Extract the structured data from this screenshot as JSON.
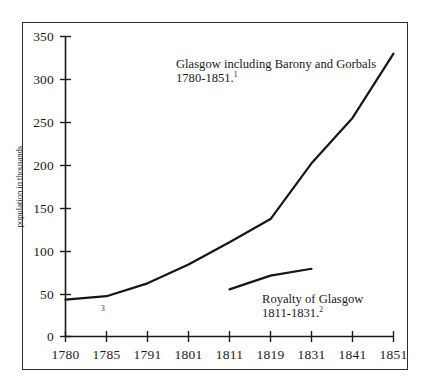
{
  "chart_data": {
    "type": "line",
    "title": "",
    "xlabel": "",
    "ylabel": "population in thousands",
    "ylim": [
      0,
      350
    ],
    "yticks": [
      0,
      50,
      100,
      150,
      200,
      250,
      300,
      350
    ],
    "xticks": [
      "1780",
      "1785",
      "1791",
      "1801",
      "1811",
      "1819",
      "1831",
      "1841",
      "1851"
    ],
    "grid": false,
    "legend_position": "inline-annotations",
    "series": [
      {
        "name": "Glasgow including Barony and Gorbals 1780-1851",
        "x": [
          "1780",
          "1785",
          "1791",
          "1801",
          "1811",
          "1819",
          "1831",
          "1841",
          "1851"
        ],
        "values": [
          43,
          47,
          62,
          84,
          110,
          137,
          202,
          255,
          330
        ]
      },
      {
        "name": "Royalty of Glasgow 1811-1831",
        "x": [
          "1811",
          "1819",
          "1831"
        ],
        "values": [
          55,
          71,
          79
        ]
      }
    ],
    "annotations": [
      {
        "id": "glasgow",
        "line1": "Glasgow including Barony and Gorbals",
        "line2": "1780-1851.",
        "footnote": "1"
      },
      {
        "id": "royalty",
        "line1": "Royalty of Glasgow",
        "line2": "1811-1831.",
        "footnote": "2"
      }
    ],
    "inline_footnote_mark": "3",
    "colors": {
      "line": "#151515",
      "axis": "#1a1a1a",
      "frame": "#2b2b2b",
      "background": "#ffffff"
    }
  },
  "axis": {
    "y_labels": [
      "350",
      "300",
      "250",
      "200",
      "150",
      "100",
      "50",
      "0"
    ],
    "x_labels": [
      "1780",
      "1785",
      "1791",
      "1801",
      "1811",
      "1819",
      "1831",
      "1841",
      "1851"
    ],
    "y_title": "population in thousands"
  }
}
